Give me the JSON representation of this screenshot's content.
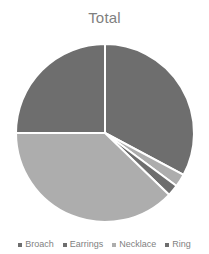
{
  "chart_data": {
    "type": "pie",
    "title": "Total",
    "categories": [
      "Broach",
      "Earrings",
      "Necklace",
      "Ring"
    ],
    "values": [
      26,
      33,
      2,
      2
    ],
    "display_percentages": [
      "26%",
      "33%",
      "2%",
      "2%"
    ],
    "colors": [
      "#6e6e6e",
      "#6e6e6e",
      "#adadad",
      "#6e6e6e"
    ],
    "slice_colors_detail": {
      "broach": "#6e6e6e",
      "earrings": "#6e6e6e",
      "necklace": "#adadad",
      "ring": "#6e6e6e",
      "remainder_light": "#adadad"
    },
    "xlabel": "",
    "ylabel": "",
    "legend_position": "bottom",
    "grid": false,
    "slice_order_clockwise_from_top": [
      "Earrings",
      "Necklace",
      "Ring",
      "Broach-light-remainder",
      "Broach"
    ],
    "start_angle_deg": 0,
    "separator_color": "#ffffff"
  },
  "chart": {
    "title": "Total",
    "geometry": {
      "center_x": 105,
      "center_y": 99,
      "radius": 89
    },
    "slices": [
      {
        "name": "Earrings",
        "start_deg": 0,
        "end_deg": 118,
        "color": "#6e6e6e"
      },
      {
        "name": "Necklace",
        "start_deg": 118,
        "end_deg": 126.5,
        "color": "#adadad"
      },
      {
        "name": "Ring",
        "start_deg": 126.5,
        "end_deg": 134,
        "color": "#6e6e6e"
      },
      {
        "name": "Broach-b",
        "start_deg": 134,
        "end_deg": 270,
        "color": "#adadad"
      },
      {
        "name": "Broach",
        "start_deg": 270,
        "end_deg": 360,
        "color": "#6e6e6e"
      }
    ]
  },
  "legend": {
    "items": [
      {
        "label": "Broach",
        "color": "#6e6e6e"
      },
      {
        "label": "Earrings",
        "color": "#6e6e6e"
      },
      {
        "label": "Necklace",
        "color": "#adadad"
      },
      {
        "label": "Ring",
        "color": "#6e6e6e"
      }
    ]
  }
}
